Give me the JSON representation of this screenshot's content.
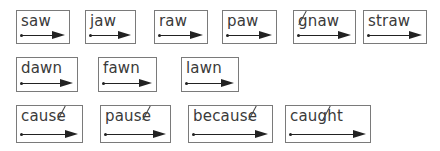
{
  "cards": [
    {
      "word": "saw",
      "left": 16,
      "top": 10,
      "width": 54,
      "height": 34
    },
    {
      "word": "jaw",
      "left": 85,
      "top": 10,
      "width": 51,
      "height": 34
    },
    {
      "word": "raw",
      "left": 154,
      "top": 10,
      "width": 54,
      "height": 34
    },
    {
      "word": "paw",
      "left": 222,
      "top": 10,
      "width": 55,
      "height": 34
    },
    {
      "word": "gnaw",
      "left": 293,
      "top": 10,
      "width": 63,
      "height": 34,
      "silent": "g"
    },
    {
      "word": "straw",
      "left": 363,
      "top": 10,
      "width": 64,
      "height": 34
    },
    {
      "word": "dawn",
      "left": 16,
      "top": 57,
      "width": 62,
      "height": 35
    },
    {
      "word": "fawn",
      "left": 98,
      "top": 57,
      "width": 59,
      "height": 35
    },
    {
      "word": "lawn",
      "left": 181,
      "top": 57,
      "width": 58,
      "height": 35
    },
    {
      "word": "cause",
      "left": 16,
      "top": 105,
      "width": 67,
      "height": 38,
      "silent": "e"
    },
    {
      "word": "pause",
      "left": 100,
      "top": 105,
      "width": 71,
      "height": 38,
      "silent": "e"
    },
    {
      "word": "because",
      "left": 188,
      "top": 105,
      "width": 85,
      "height": 38,
      "silent": "e"
    },
    {
      "word": "caught",
      "left": 285,
      "top": 105,
      "width": 86,
      "height": 38,
      "silent": "gh"
    }
  ],
  "colors": {
    "border": "#7a7a7a",
    "text": "#3a3a3a",
    "arrow": "#222222"
  }
}
